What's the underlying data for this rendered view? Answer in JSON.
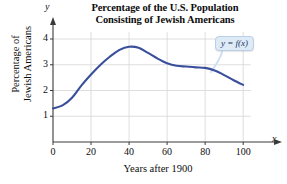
{
  "chart_data": {
    "type": "line",
    "title": "Percentage of the U.S. Population Consisting of Jewish Americans",
    "title_line1": "Percentage of the U.S. Population",
    "title_line2": "Consisting of Jewish Americans",
    "xlabel": "Years after 1900",
    "ylabel": "Percentage of Jewish Americans",
    "ylabel_line1": "Percentage of",
    "ylabel_line2": "Jewish Americans",
    "x_axis_letter": "x",
    "y_axis_letter": "y",
    "xlim": [
      0,
      112
    ],
    "ylim": [
      0,
      4.35
    ],
    "xticks": [
      0,
      20,
      40,
      60,
      80,
      100
    ],
    "yticks": [
      1,
      2,
      3,
      4
    ],
    "grid": true,
    "legend_position": "inside-top-right",
    "annotations": [
      {
        "text": "y = f(x)",
        "x": 88,
        "y": 3.85
      }
    ],
    "series": [
      {
        "name": "y = f(x)",
        "color": "#3a4f9c",
        "x": [
          0,
          5,
          10,
          15,
          20,
          25,
          30,
          35,
          40,
          45,
          50,
          55,
          60,
          65,
          70,
          75,
          80,
          85,
          90,
          95,
          100
        ],
        "values": [
          1.3,
          1.42,
          1.72,
          2.2,
          2.62,
          3.0,
          3.32,
          3.58,
          3.7,
          3.66,
          3.46,
          3.24,
          3.06,
          2.96,
          2.93,
          2.9,
          2.88,
          2.78,
          2.6,
          2.4,
          2.22
        ]
      }
    ]
  },
  "colors": {
    "curve": "#3a4f9c",
    "grid": "#d6d6d6",
    "axis": "#3a3a3a",
    "callout_fill": "#dfeaf7",
    "callout_border": "#b9cfe6",
    "callout_text": "#17365d"
  }
}
